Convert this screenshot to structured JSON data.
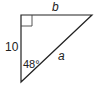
{
  "diagram": {
    "type": "right-triangle",
    "labels": {
      "top_side": "b",
      "left_side": "10",
      "hypotenuse": "a",
      "angle": "48°"
    },
    "right_angle_marker": true,
    "colors": {
      "stroke": "#222222",
      "background": "#ffffff"
    }
  }
}
